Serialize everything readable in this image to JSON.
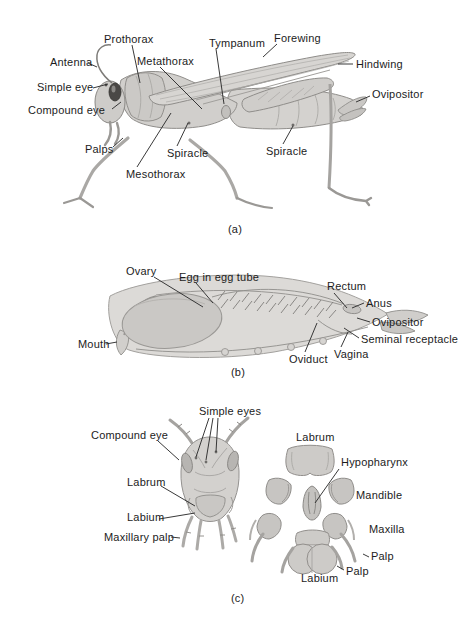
{
  "palette": {
    "ink": "#1c1c1c",
    "leader_line": "#2e2e2e",
    "body_light": "#d4d2cf",
    "body_mid": "#cac8c5",
    "outline": "#8f8d8a",
    "eye": "#4a4846",
    "background": "#ffffff"
  },
  "panel_a": {
    "caption": "(a)",
    "labels": {
      "antenna": "Antenna",
      "prothorax": "Prothorax",
      "metathorax": "Metathorax",
      "tympanum": "Tympanum",
      "forewing": "Forewing",
      "hindwing": "Hindwing",
      "ovipositor": "Ovipositor",
      "simple_eye": "Simple eye",
      "compound_eye": "Compound eye",
      "palps": "Palps",
      "spiracle_left": "Spiracle",
      "spiracle_right": "Spiracle",
      "mesothorax": "Mesothorax"
    }
  },
  "panel_b": {
    "caption": "(b)",
    "labels": {
      "ovary": "Ovary",
      "egg_in_egg_tube": "Egg in egg tube",
      "rectum": "Rectum",
      "anus": "Anus",
      "ovipositor": "Ovipositor",
      "seminal_receptacle": "Seminal receptacle",
      "vagina": "Vagina",
      "oviduct": "Oviduct",
      "mouth": "Mouth"
    }
  },
  "panel_c": {
    "caption": "(c)",
    "labels": {
      "simple_eyes": "Simple eyes",
      "compound_eye": "Compound eye",
      "labrum_head": "Labrum",
      "labium_head": "Labium",
      "maxillary_palp": "Maxillary palp",
      "labrum_mouthpart": "Labrum",
      "hypopharynx": "Hypopharynx",
      "mandible": "Mandible",
      "maxilla": "Maxilla",
      "palp_maxillary": "Palp",
      "palp_labial": "Palp",
      "labium_mouthpart": "Labium"
    }
  }
}
